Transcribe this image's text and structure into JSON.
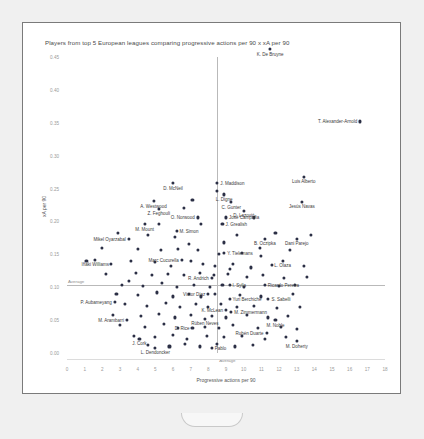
{
  "card": {
    "title": "Players from top 5 European leagues comparing progressive actions per 90 x xA per 90"
  },
  "axes": {
    "xlabel": "Progressive actions per 90",
    "ylabel": "xA per 90",
    "xticks": [
      "0",
      "1",
      "2",
      "3",
      "4",
      "5",
      "6",
      "7",
      "8",
      "9",
      "10",
      "11",
      "12",
      "13",
      "14",
      "15",
      "16",
      "17",
      "18"
    ],
    "yticks": [
      "0.00",
      "0.05",
      "0.10",
      "0.15",
      "0.20",
      "0.25",
      "0.30",
      "0.35",
      "0.40",
      "0.45"
    ],
    "avg_vertical_label": "Average",
    "avg_horizontal_label": "Average"
  },
  "colors": {
    "dot": "#2b2f45",
    "axis": "#b9b9b9",
    "text": "#4a4a4a",
    "card_border": "#7a7a7a"
  },
  "chart_data": {
    "type": "scatter",
    "title": "Players from top 5 European leagues comparing progressive actions per 90 x xA per 90",
    "xlabel": "Progressive actions per 90",
    "ylabel": "xA per 90",
    "xlim": [
      0,
      18
    ],
    "ylim": [
      0.0,
      0.45
    ],
    "grid": false,
    "legend": null,
    "reference_lines": [
      {
        "orientation": "vertical",
        "x": 8.5,
        "label": "Average"
      },
      {
        "orientation": "horizontal",
        "y": 0.103,
        "label": "Average"
      }
    ],
    "labeled_points": [
      {
        "name": "K. De Bruyne",
        "x": 11.5,
        "y": 0.462,
        "pos": "below"
      },
      {
        "name": "T. Alexander-Arnold",
        "x": 16.6,
        "y": 0.352,
        "pos": "left"
      },
      {
        "name": "Luis Alberto",
        "x": 13.4,
        "y": 0.268,
        "pos": "below"
      },
      {
        "name": "D. McNeil",
        "x": 6.0,
        "y": 0.258,
        "pos": "below"
      },
      {
        "name": "J. Maddison",
        "x": 8.5,
        "y": 0.258,
        "pos": "right"
      },
      {
        "name": "Jesús Navas",
        "x": 13.3,
        "y": 0.23,
        "pos": "below"
      },
      {
        "name": "L. Digne",
        "x": 8.9,
        "y": 0.241,
        "pos": "below"
      },
      {
        "name": "A. Westwood",
        "x": 4.9,
        "y": 0.231,
        "pos": "below"
      },
      {
        "name": "C. Gunter",
        "x": 9.3,
        "y": 0.229,
        "pos": "below"
      },
      {
        "name": "Z. Feghouli",
        "x": 5.2,
        "y": 0.219,
        "pos": "below"
      },
      {
        "name": "D. Lazović",
        "x": 10.0,
        "y": 0.216,
        "pos": "below"
      },
      {
        "name": "O. Norwood",
        "x": 7.4,
        "y": 0.206,
        "pos": "left"
      },
      {
        "name": "José Campaña",
        "x": 9.0,
        "y": 0.206,
        "pos": "right"
      },
      {
        "name": "M. Mount",
        "x": 4.4,
        "y": 0.196,
        "pos": "below"
      },
      {
        "name": "J. Grealish",
        "x": 8.8,
        "y": 0.196,
        "pos": "right"
      },
      {
        "name": "M. Simon",
        "x": 6.2,
        "y": 0.186,
        "pos": "right"
      },
      {
        "name": "Mikel Oyarzabal",
        "x": 3.5,
        "y": 0.174,
        "pos": "left"
      },
      {
        "name": "B. Oczipka",
        "x": 11.2,
        "y": 0.174,
        "pos": "below"
      },
      {
        "name": "Dani Parejo",
        "x": 13.0,
        "y": 0.174,
        "pos": "below"
      },
      {
        "name": "Y. Tielemans",
        "x": 8.9,
        "y": 0.152,
        "pos": "right"
      },
      {
        "name": "Iñaki Williams",
        "x": 1.6,
        "y": 0.142,
        "pos": "below"
      },
      {
        "name": "Marc Cucurella",
        "x": 6.5,
        "y": 0.142,
        "pos": "left"
      },
      {
        "name": "L. Olaza",
        "x": 12.2,
        "y": 0.14,
        "pos": "below"
      },
      {
        "name": "R. Andrich",
        "x": 8.2,
        "y": 0.114,
        "pos": "left"
      },
      {
        "name": "I. Sylla",
        "x": 9.2,
        "y": 0.104,
        "pos": "right"
      },
      {
        "name": "Ricardo Pereira",
        "x": 11.2,
        "y": 0.104,
        "pos": "right"
      },
      {
        "name": "Víctor Díaz",
        "x": 8.0,
        "y": 0.09,
        "pos": "left"
      },
      {
        "name": "Yuri Berchiche",
        "x": 9.2,
        "y": 0.082,
        "pos": "right"
      },
      {
        "name": "S. Sabelli",
        "x": 11.4,
        "y": 0.082,
        "pos": "right"
      },
      {
        "name": "P. Aubameyang",
        "x": 2.7,
        "y": 0.077,
        "pos": "left"
      },
      {
        "name": "K. McLean",
        "x": 9.0,
        "y": 0.066,
        "pos": "left"
      },
      {
        "name": "M. Zimmermann",
        "x": 9.3,
        "y": 0.062,
        "pos": "right"
      },
      {
        "name": "Rúben Neves",
        "x": 7.8,
        "y": 0.052,
        "pos": "below"
      },
      {
        "name": "M. Arambarri",
        "x": 3.4,
        "y": 0.05,
        "pos": "left"
      },
      {
        "name": "M. Noble",
        "x": 11.8,
        "y": 0.05,
        "pos": "below"
      },
      {
        "name": "D. Rice",
        "x": 7.1,
        "y": 0.038,
        "pos": "left"
      },
      {
        "name": "Rubén Duarte",
        "x": 11.3,
        "y": 0.03,
        "pos": "left"
      },
      {
        "name": "J. Cork",
        "x": 4.1,
        "y": 0.022,
        "pos": "below"
      },
      {
        "name": "M. Doherty",
        "x": 13.0,
        "y": 0.018,
        "pos": "below"
      },
      {
        "name": "L. Dendoncker",
        "x": 5.0,
        "y": 0.008,
        "pos": "below"
      },
      {
        "name": "Pablo",
        "x": 8.2,
        "y": 0.008,
        "pos": "right"
      }
    ],
    "unlabeled_points": [
      {
        "x": 7.1,
        "y": 0.232
      },
      {
        "x": 8.5,
        "y": 0.246
      },
      {
        "x": 6.6,
        "y": 0.22
      },
      {
        "x": 10.6,
        "y": 0.206
      },
      {
        "x": 5.2,
        "y": 0.196
      },
      {
        "x": 7.6,
        "y": 0.196
      },
      {
        "x": 2.9,
        "y": 0.182
      },
      {
        "x": 4.6,
        "y": 0.18
      },
      {
        "x": 6.1,
        "y": 0.176
      },
      {
        "x": 9.6,
        "y": 0.18
      },
      {
        "x": 11.8,
        "y": 0.182
      },
      {
        "x": 13.8,
        "y": 0.18
      },
      {
        "x": 2.0,
        "y": 0.16
      },
      {
        "x": 4.0,
        "y": 0.158
      },
      {
        "x": 5.3,
        "y": 0.156
      },
      {
        "x": 6.3,
        "y": 0.158
      },
      {
        "x": 7.4,
        "y": 0.156
      },
      {
        "x": 8.6,
        "y": 0.15
      },
      {
        "x": 9.9,
        "y": 0.152
      },
      {
        "x": 11.0,
        "y": 0.148
      },
      {
        "x": 12.6,
        "y": 0.156
      },
      {
        "x": 1.1,
        "y": 0.14
      },
      {
        "x": 2.5,
        "y": 0.136
      },
      {
        "x": 3.6,
        "y": 0.14
      },
      {
        "x": 5.0,
        "y": 0.138
      },
      {
        "x": 5.9,
        "y": 0.133
      },
      {
        "x": 7.0,
        "y": 0.14
      },
      {
        "x": 7.7,
        "y": 0.136
      },
      {
        "x": 8.4,
        "y": 0.132
      },
      {
        "x": 9.4,
        "y": 0.136
      },
      {
        "x": 10.4,
        "y": 0.13
      },
      {
        "x": 11.6,
        "y": 0.134
      },
      {
        "x": 13.4,
        "y": 0.132
      },
      {
        "x": 2.2,
        "y": 0.12
      },
      {
        "x": 3.9,
        "y": 0.122
      },
      {
        "x": 4.8,
        "y": 0.118
      },
      {
        "x": 5.7,
        "y": 0.12
      },
      {
        "x": 6.6,
        "y": 0.118
      },
      {
        "x": 7.5,
        "y": 0.122
      },
      {
        "x": 8.3,
        "y": 0.118
      },
      {
        "x": 9.1,
        "y": 0.12
      },
      {
        "x": 10.2,
        "y": 0.116
      },
      {
        "x": 11.1,
        "y": 0.118
      },
      {
        "x": 12.3,
        "y": 0.114
      },
      {
        "x": 13.6,
        "y": 0.116
      },
      {
        "x": 3.1,
        "y": 0.104
      },
      {
        "x": 4.3,
        "y": 0.102
      },
      {
        "x": 5.4,
        "y": 0.106
      },
      {
        "x": 6.2,
        "y": 0.1
      },
      {
        "x": 7.2,
        "y": 0.104
      },
      {
        "x": 8.1,
        "y": 0.1
      },
      {
        "x": 8.8,
        "y": 0.104
      },
      {
        "x": 10.0,
        "y": 0.1
      },
      {
        "x": 12.0,
        "y": 0.102
      },
      {
        "x": 2.8,
        "y": 0.09
      },
      {
        "x": 4.0,
        "y": 0.088
      },
      {
        "x": 5.1,
        "y": 0.092
      },
      {
        "x": 6.0,
        "y": 0.086
      },
      {
        "x": 6.9,
        "y": 0.09
      },
      {
        "x": 7.6,
        "y": 0.086
      },
      {
        "x": 8.4,
        "y": 0.09
      },
      {
        "x": 9.8,
        "y": 0.088
      },
      {
        "x": 11.0,
        "y": 0.086
      },
      {
        "x": 12.8,
        "y": 0.09
      },
      {
        "x": 3.3,
        "y": 0.074
      },
      {
        "x": 4.5,
        "y": 0.072
      },
      {
        "x": 5.6,
        "y": 0.076
      },
      {
        "x": 6.4,
        "y": 0.07
      },
      {
        "x": 7.3,
        "y": 0.074
      },
      {
        "x": 8.0,
        "y": 0.07
      },
      {
        "x": 8.7,
        "y": 0.074
      },
      {
        "x": 9.6,
        "y": 0.07
      },
      {
        "x": 10.6,
        "y": 0.072
      },
      {
        "x": 11.9,
        "y": 0.068
      },
      {
        "x": 13.2,
        "y": 0.07
      },
      {
        "x": 2.6,
        "y": 0.058
      },
      {
        "x": 4.2,
        "y": 0.056
      },
      {
        "x": 5.2,
        "y": 0.06
      },
      {
        "x": 6.1,
        "y": 0.054
      },
      {
        "x": 7.0,
        "y": 0.058
      },
      {
        "x": 8.2,
        "y": 0.056
      },
      {
        "x": 9.0,
        "y": 0.054
      },
      {
        "x": 10.2,
        "y": 0.058
      },
      {
        "x": 11.4,
        "y": 0.054
      },
      {
        "x": 12.5,
        "y": 0.056
      },
      {
        "x": 3.0,
        "y": 0.042
      },
      {
        "x": 4.4,
        "y": 0.04
      },
      {
        "x": 5.5,
        "y": 0.044
      },
      {
        "x": 6.3,
        "y": 0.038
      },
      {
        "x": 7.8,
        "y": 0.04
      },
      {
        "x": 8.6,
        "y": 0.038
      },
      {
        "x": 9.4,
        "y": 0.042
      },
      {
        "x": 10.8,
        "y": 0.038
      },
      {
        "x": 12.1,
        "y": 0.04
      },
      {
        "x": 13.0,
        "y": 0.036
      },
      {
        "x": 3.8,
        "y": 0.026
      },
      {
        "x": 5.0,
        "y": 0.024
      },
      {
        "x": 6.0,
        "y": 0.028
      },
      {
        "x": 6.8,
        "y": 0.022
      },
      {
        "x": 7.9,
        "y": 0.026
      },
      {
        "x": 8.9,
        "y": 0.024
      },
      {
        "x": 9.9,
        "y": 0.026
      },
      {
        "x": 11.2,
        "y": 0.022
      },
      {
        "x": 12.4,
        "y": 0.024
      },
      {
        "x": 4.6,
        "y": 0.012
      },
      {
        "x": 5.8,
        "y": 0.01
      },
      {
        "x": 6.7,
        "y": 0.014
      },
      {
        "x": 7.5,
        "y": 0.01
      },
      {
        "x": 8.5,
        "y": 0.014
      },
      {
        "x": 9.5,
        "y": 0.01
      },
      {
        "x": 10.5,
        "y": 0.012
      },
      {
        "x": 3.5,
        "y": 0.11
      },
      {
        "x": 9.2,
        "y": 0.128
      },
      {
        "x": 12.9,
        "y": 0.104
      },
      {
        "x": 10.9,
        "y": 0.16
      },
      {
        "x": 8.9,
        "y": 0.168
      },
      {
        "x": 6.9,
        "y": 0.166
      }
    ]
  }
}
